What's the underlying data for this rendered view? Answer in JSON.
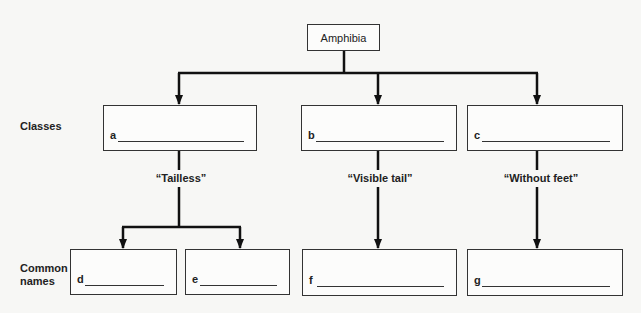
{
  "diagram": {
    "root": "Amphibia",
    "row_labels": {
      "classes": "Classes",
      "common_names": "Common names"
    },
    "classes": [
      {
        "id": "a",
        "letter": "a",
        "answer": ""
      },
      {
        "id": "b",
        "letter": "b",
        "answer": ""
      },
      {
        "id": "c",
        "letter": "c",
        "answer": ""
      }
    ],
    "branch_labels": {
      "a": "“Tailless”",
      "b": "“Visible tail”",
      "c": "“Without feet”"
    },
    "common_names": [
      {
        "id": "d",
        "letter": "d",
        "answer": ""
      },
      {
        "id": "e",
        "letter": "e",
        "answer": ""
      },
      {
        "id": "f",
        "letter": "f",
        "answer": ""
      },
      {
        "id": "g",
        "letter": "g",
        "answer": ""
      }
    ]
  }
}
